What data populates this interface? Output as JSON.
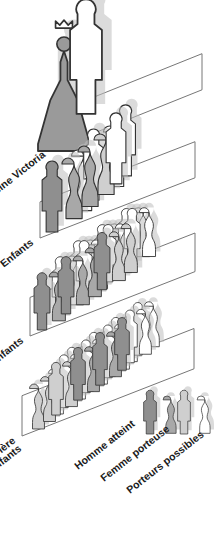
{
  "diagram": {
    "type": "pedigree-isometric",
    "subject": "Reine Victoria",
    "generation_count": 4,
    "background_color": "#ffffff",
    "panel_stroke_color": "#777777",
    "figure_stroke_color": "#333333"
  },
  "palette": {
    "affected_male": "#8f8f8f",
    "carrier_female": "#a8a8a8",
    "possible_carrier": "#cfcfcf",
    "unaffected": "#ffffff",
    "victoria_dress": "#9a9a9a",
    "shadow": "#bdbdbd"
  },
  "tiers": [
    {
      "id": "tier-victoria",
      "label": "Reine Victoria",
      "label_lines": [
        "Reine Victoria"
      ],
      "figure_count": 2,
      "figures": [
        {
          "kind": "queen",
          "shade": "victoria_dress"
        },
        {
          "kind": "male",
          "shade": "unaffected"
        }
      ]
    },
    {
      "id": "tier-enfants",
      "label": "Enfants",
      "label_lines": [
        "Enfants"
      ],
      "figure_count": 9,
      "figures": [
        {
          "kind": "male",
          "shade": "affected_male"
        },
        {
          "kind": "female",
          "shade": "carrier_female"
        },
        {
          "kind": "female",
          "shade": "carrier_female"
        },
        {
          "kind": "female",
          "shade": "possible_carrier"
        },
        {
          "kind": "male",
          "shade": "unaffected"
        },
        {
          "kind": "female",
          "shade": "unaffected"
        },
        {
          "kind": "male",
          "shade": "unaffected"
        },
        {
          "kind": "female",
          "shade": "unaffected"
        },
        {
          "kind": "male",
          "shade": "unaffected"
        }
      ]
    },
    {
      "id": "tier-petits-enfants",
      "label": "Petits-enfants",
      "label_lines": [
        "Petits-enfants"
      ],
      "figure_count": 22,
      "figures": [
        {
          "kind": "male",
          "shade": "affected_male"
        },
        {
          "kind": "female",
          "shade": "carrier_female"
        },
        {
          "kind": "male",
          "shade": "affected_male"
        },
        {
          "kind": "female",
          "shade": "carrier_female"
        },
        {
          "kind": "female",
          "shade": "carrier_female"
        },
        {
          "kind": "male",
          "shade": "affected_male"
        },
        {
          "kind": "female",
          "shade": "possible_carrier"
        },
        {
          "kind": "female",
          "shade": "possible_carrier"
        },
        {
          "kind": "male",
          "shade": "unaffected"
        },
        {
          "kind": "female",
          "shade": "unaffected"
        },
        {
          "kind": "male",
          "shade": "unaffected"
        },
        {
          "kind": "female",
          "shade": "unaffected"
        },
        {
          "kind": "male",
          "shade": "unaffected"
        },
        {
          "kind": "female",
          "shade": "unaffected"
        },
        {
          "kind": "male",
          "shade": "unaffected"
        },
        {
          "kind": "female",
          "shade": "unaffected"
        },
        {
          "kind": "male",
          "shade": "unaffected"
        },
        {
          "kind": "female",
          "shade": "unaffected"
        },
        {
          "kind": "male",
          "shade": "unaffected"
        },
        {
          "kind": "female",
          "shade": "unaffected"
        },
        {
          "kind": "male",
          "shade": "unaffected"
        },
        {
          "kind": "female",
          "shade": "unaffected"
        }
      ]
    },
    {
      "id": "tier-arriere-petits-enfants",
      "label": "Arrière petits-enfants",
      "label_lines": [
        "Arrière",
        "petits-enfants"
      ],
      "figure_count": 26,
      "figures": [
        {
          "kind": "female",
          "shade": "possible_carrier"
        },
        {
          "kind": "female",
          "shade": "possible_carrier"
        },
        {
          "kind": "male",
          "shade": "possible_carrier"
        },
        {
          "kind": "female",
          "shade": "possible_carrier"
        },
        {
          "kind": "male",
          "shade": "affected_male"
        },
        {
          "kind": "female",
          "shade": "carrier_female"
        },
        {
          "kind": "male",
          "shade": "affected_male"
        },
        {
          "kind": "female",
          "shade": "carrier_female"
        },
        {
          "kind": "male",
          "shade": "affected_male"
        },
        {
          "kind": "female",
          "shade": "unaffected"
        },
        {
          "kind": "male",
          "shade": "unaffected"
        },
        {
          "kind": "female",
          "shade": "unaffected"
        },
        {
          "kind": "male",
          "shade": "unaffected"
        },
        {
          "kind": "female",
          "shade": "unaffected"
        },
        {
          "kind": "male",
          "shade": "unaffected"
        },
        {
          "kind": "female",
          "shade": "unaffected"
        },
        {
          "kind": "male",
          "shade": "unaffected"
        },
        {
          "kind": "female",
          "shade": "unaffected"
        },
        {
          "kind": "male",
          "shade": "unaffected"
        },
        {
          "kind": "female",
          "shade": "unaffected"
        },
        {
          "kind": "male",
          "shade": "unaffected"
        },
        {
          "kind": "female",
          "shade": "unaffected"
        },
        {
          "kind": "male",
          "shade": "unaffected"
        },
        {
          "kind": "female",
          "shade": "unaffected"
        },
        {
          "kind": "male",
          "shade": "unaffected"
        },
        {
          "kind": "female",
          "shade": "unaffected"
        }
      ]
    }
  ],
  "legend": {
    "items": [
      {
        "id": "homme-atteint",
        "label": "Homme atteint",
        "shade": "affected_male",
        "kind": "male"
      },
      {
        "id": "femme-porteuse",
        "label": "Femme porteuse",
        "shade": "carrier_female",
        "kind": "female"
      },
      {
        "id": "porteurs-possibles",
        "label": "Porteurs possibles",
        "shade": "possible_carrier",
        "kind": "male"
      },
      {
        "id": "porteurs-possibles-2",
        "label": "",
        "shade": "unaffected",
        "kind": "female"
      }
    ],
    "label_texts": [
      "Homme atteint",
      "Femme porteuse",
      "Porteurs possibles"
    ]
  }
}
